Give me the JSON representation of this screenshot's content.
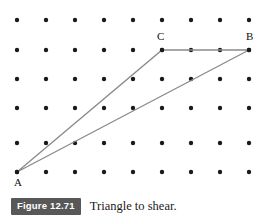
{
  "figure": {
    "badge_label": "Figure 12.71",
    "caption": "Triangle to shear.",
    "badge_color": "#585858",
    "badge_text_color": "#ffffff"
  },
  "plot": {
    "background": "#ffffff",
    "dot_color": "#1a1a1a",
    "dot_radius": 2.2,
    "line_color": "#8a8a8a",
    "line_width": 1.3,
    "grid": {
      "columns": 9,
      "rows": 6,
      "x_origin": 17,
      "x_spacing": 29,
      "row_y": [
        20,
        50,
        79,
        108,
        143,
        172
      ]
    },
    "dots": [
      {
        "x": 17,
        "y": 20
      },
      {
        "x": 46,
        "y": 20
      },
      {
        "x": 75,
        "y": 20
      },
      {
        "x": 104,
        "y": 20
      },
      {
        "x": 133,
        "y": 20
      },
      {
        "x": 162,
        "y": 20
      },
      {
        "x": 191,
        "y": 20
      },
      {
        "x": 220,
        "y": 20
      },
      {
        "x": 249,
        "y": 20
      },
      {
        "x": 17,
        "y": 50
      },
      {
        "x": 46,
        "y": 50
      },
      {
        "x": 75,
        "y": 50
      },
      {
        "x": 104,
        "y": 50
      },
      {
        "x": 133,
        "y": 50
      },
      {
        "x": 162,
        "y": 50
      },
      {
        "x": 191,
        "y": 50
      },
      {
        "x": 220,
        "y": 50
      },
      {
        "x": 249,
        "y": 50
      },
      {
        "x": 17,
        "y": 79
      },
      {
        "x": 46,
        "y": 79
      },
      {
        "x": 75,
        "y": 79
      },
      {
        "x": 104,
        "y": 79
      },
      {
        "x": 133,
        "y": 79
      },
      {
        "x": 162,
        "y": 79
      },
      {
        "x": 191,
        "y": 79
      },
      {
        "x": 220,
        "y": 79
      },
      {
        "x": 249,
        "y": 79
      },
      {
        "x": 17,
        "y": 108
      },
      {
        "x": 46,
        "y": 108
      },
      {
        "x": 75,
        "y": 108
      },
      {
        "x": 104,
        "y": 108
      },
      {
        "x": 133,
        "y": 108
      },
      {
        "x": 162,
        "y": 108
      },
      {
        "x": 191,
        "y": 108
      },
      {
        "x": 220,
        "y": 108
      },
      {
        "x": 249,
        "y": 108
      },
      {
        "x": 17,
        "y": 143
      },
      {
        "x": 46,
        "y": 143
      },
      {
        "x": 75,
        "y": 143
      },
      {
        "x": 104,
        "y": 143
      },
      {
        "x": 133,
        "y": 143
      },
      {
        "x": 162,
        "y": 143
      },
      {
        "x": 191,
        "y": 143
      },
      {
        "x": 220,
        "y": 143
      },
      {
        "x": 249,
        "y": 143
      },
      {
        "x": 17,
        "y": 172
      },
      {
        "x": 46,
        "y": 172
      },
      {
        "x": 75,
        "y": 172
      },
      {
        "x": 104,
        "y": 172
      },
      {
        "x": 133,
        "y": 172
      },
      {
        "x": 162,
        "y": 172
      },
      {
        "x": 191,
        "y": 172
      },
      {
        "x": 220,
        "y": 172
      },
      {
        "x": 249,
        "y": 172
      }
    ],
    "triangle": {
      "vertices": [
        {
          "name": "A",
          "label": "A",
          "x": 17,
          "y": 172,
          "label_x": 14,
          "label_y": 177
        },
        {
          "name": "C",
          "label": "C",
          "x": 162,
          "y": 50,
          "label_x": 157,
          "label_y": 31
        },
        {
          "name": "B",
          "label": "B",
          "x": 249,
          "y": 50,
          "label_x": 246,
          "label_y": 31
        }
      ],
      "edges": [
        {
          "from": "A",
          "to": "C"
        },
        {
          "from": "C",
          "to": "B"
        },
        {
          "from": "B",
          "to": "A"
        }
      ],
      "path": "M 17 172 L 162 50 L 249 50 Z"
    }
  }
}
